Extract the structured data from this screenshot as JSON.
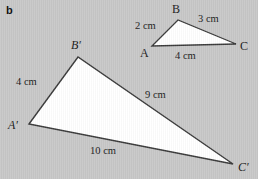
{
  "figure": {
    "part_label": "b",
    "background_color": "#c8c8c8",
    "fill_color": "#ffffff",
    "stroke_color": "#3a3a3a",
    "text_color": "#1b1b1b"
  },
  "small_triangle": {
    "name": "triangle-ABC",
    "vertices": [
      {
        "id": "A",
        "label": "A",
        "x": 152,
        "y": 46,
        "label_x": 140,
        "label_y": 47
      },
      {
        "id": "B",
        "label": "B",
        "x": 178,
        "y": 20,
        "label_x": 172,
        "label_y": 3
      },
      {
        "id": "C",
        "label": "C",
        "x": 236,
        "y": 44,
        "label_x": 240,
        "label_y": 40
      }
    ],
    "sides": [
      {
        "id": "AB",
        "label": "2 cm",
        "label_x": 135,
        "label_y": 21
      },
      {
        "id": "BC",
        "label": "3 cm",
        "label_x": 198,
        "label_y": 14
      },
      {
        "id": "CA",
        "label": "4 cm",
        "label_x": 175,
        "label_y": 51
      }
    ]
  },
  "large_triangle": {
    "name": "triangle-A-prime-B-prime-C-prime",
    "vertices": [
      {
        "id": "A'",
        "label": "A′",
        "x": 29,
        "y": 124,
        "label_x": 8,
        "label_y": 119
      },
      {
        "id": "B'",
        "label": "B′",
        "x": 78,
        "y": 57,
        "label_x": 71,
        "label_y": 39
      },
      {
        "id": "C'",
        "label": "C′",
        "x": 233,
        "y": 164,
        "label_x": 238,
        "label_y": 161
      }
    ],
    "sides": [
      {
        "id": "A'B'",
        "label": "4 cm",
        "label_x": 16,
        "label_y": 77
      },
      {
        "id": "B'C'",
        "label": "9 cm",
        "label_x": 145,
        "label_y": 90
      },
      {
        "id": "C'A'",
        "label": "10 cm",
        "label_x": 90,
        "label_y": 146
      }
    ]
  }
}
